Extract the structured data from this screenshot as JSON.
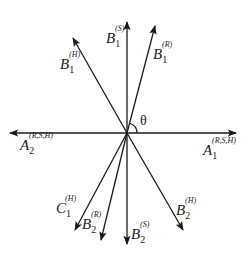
{
  "diagram": {
    "origin": [
      127,
      133
    ],
    "angle_label": "θ",
    "vectors": [
      {
        "id": "B1S",
        "name": "B",
        "sub": "1",
        "sup": "(S)",
        "tip": [
          127,
          22
        ]
      },
      {
        "id": "B1R",
        "name": "B",
        "sub": "1",
        "sup": "(R)",
        "tip": [
          155,
          26
        ]
      },
      {
        "id": "B1H",
        "name": "B",
        "sub": "1",
        "sup": "(H)",
        "tip": [
          73,
          38
        ]
      },
      {
        "id": "A1",
        "name": "A",
        "sub": "1",
        "sup": "(R,S,H)",
        "tip": [
          236,
          133
        ]
      },
      {
        "id": "A2",
        "name": "A",
        "sub": "2",
        "sup": "(R,S,H)",
        "tip": [
          10,
          133
        ]
      },
      {
        "id": "C1H",
        "name": "C",
        "sub": "1",
        "sup": "(H)",
        "tip": [
          75,
          230
        ]
      },
      {
        "id": "B2R",
        "name": "B",
        "sub": "2",
        "sup": "(R)",
        "tip": [
          101,
          240
        ]
      },
      {
        "id": "B2S",
        "name": "B",
        "sub": "2",
        "sup": "(S)",
        "tip": [
          127,
          244
        ]
      },
      {
        "id": "B2H",
        "name": "B",
        "sub": "2",
        "sup": "(H)",
        "tip": [
          183,
          230
        ]
      }
    ],
    "labels": {
      "B1S": {
        "name": "B",
        "sub": "1",
        "sup": "(S)"
      },
      "B1R": {
        "name": "B",
        "sub": "1",
        "sup": "(R)"
      },
      "B1H": {
        "name": "B",
        "sub": "1",
        "sup": "(H)"
      },
      "A1": {
        "name": "A",
        "sub": "1",
        "sup": "(R,S,H)"
      },
      "A2": {
        "name": "A",
        "sub": "2",
        "sup": "(R,S,H)"
      },
      "C1H": {
        "name": "C",
        "sub": "1",
        "sup": "(H)"
      },
      "B2R": {
        "name": "B",
        "sub": "2",
        "sup": "(R)"
      },
      "B2S": {
        "name": "B",
        "sub": "2",
        "sup": "(S)"
      },
      "B2H": {
        "name": "B",
        "sub": "2",
        "sup": "(H)"
      }
    },
    "colors": {
      "stroke": "#1a1a1a",
      "background": "#ffffff"
    }
  }
}
